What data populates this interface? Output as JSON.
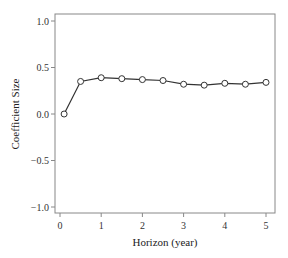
{
  "chart_data": {
    "type": "line",
    "title": "",
    "xlabel": "Horizon (year)",
    "ylabel": "Coefficient Size",
    "xlim": [
      -0.1,
      5.2
    ],
    "ylim": [
      -1.08,
      1.08
    ],
    "xticks": [
      0,
      1,
      2,
      3,
      4,
      5
    ],
    "xtick_labels": [
      "0",
      "1",
      "2",
      "3",
      "4",
      "5"
    ],
    "yticks": [
      1.0,
      0.5,
      0.0,
      -0.5,
      -1.0
    ],
    "ytick_labels": [
      "1.0",
      "0.5",
      "0.0",
      "−0.5",
      "−1.0"
    ],
    "grid": false,
    "legend": null,
    "series": [
      {
        "name": "Coefficient",
        "marker": "open-circle",
        "color": "#333333",
        "x": [
          0.1,
          0.5,
          1.0,
          1.5,
          2.0,
          2.5,
          3.0,
          3.5,
          4.0,
          4.5,
          5.0
        ],
        "y": [
          0.0,
          0.35,
          0.39,
          0.38,
          0.37,
          0.36,
          0.32,
          0.31,
          0.33,
          0.32,
          0.34
        ]
      }
    ]
  },
  "colors": {
    "frame": "#888888",
    "line": "#333333",
    "marker_fill": "#ffffff",
    "text": "#333333"
  }
}
